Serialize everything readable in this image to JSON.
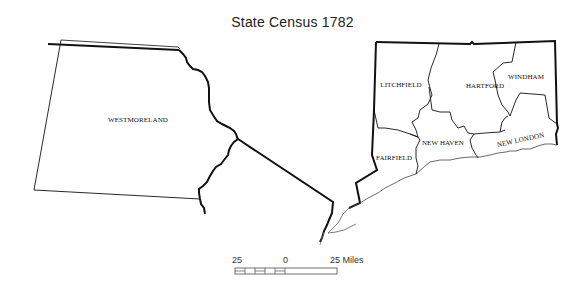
{
  "title": "State Census  1782",
  "regions": [
    {
      "name": "WESTMORELAND",
      "state": "Pennsylvania portion"
    },
    {
      "name": "LITCHFIELD"
    },
    {
      "name": "HARTFORD"
    },
    {
      "name": "WINDHAM"
    },
    {
      "name": "FAIRFIELD"
    },
    {
      "name": "NEW HAVEN"
    },
    {
      "name": "NEW LONDON"
    }
  ],
  "scale_bar": {
    "left_label": "25",
    "mid_label": "0",
    "right_label": "25 Miles"
  },
  "colors": {
    "border": "#111111",
    "coast": "#555555",
    "background": "#ffffff"
  }
}
